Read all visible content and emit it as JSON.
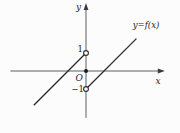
{
  "chart_data": {
    "type": "line",
    "title": "",
    "curve_label": "y=f(x)",
    "x_axis_label": "x",
    "y_axis_label": "y",
    "origin_label": "O",
    "grid": false,
    "legend": "none",
    "x_range": [
      -4.2,
      4.1
    ],
    "y_range": [
      -2.6,
      3.5
    ],
    "y_ticks": [
      {
        "value": 1,
        "label": "1"
      },
      {
        "value": -1,
        "label": "−1"
      }
    ],
    "series": [
      {
        "name": "left-branch",
        "points": [
          [
            -2.9,
            -1.9
          ],
          [
            0,
            1
          ]
        ]
      },
      {
        "name": "right-branch",
        "points": [
          [
            0,
            -1
          ],
          [
            2.8,
            1.8
          ]
        ]
      }
    ],
    "special_points": [
      {
        "x": 0,
        "y": 1,
        "style": "open"
      },
      {
        "x": 0,
        "y": -1,
        "style": "open"
      },
      {
        "x": 0,
        "y": 0,
        "style": "filled"
      }
    ],
    "colors": {
      "axis": "#5f5f5f",
      "arrow": "#3a3a3a",
      "curve": "#2a2a2a",
      "point_fill_open": "#ffffff",
      "point_fill_closed": "#1a1a1a",
      "background": "#fcfcfc"
    }
  }
}
